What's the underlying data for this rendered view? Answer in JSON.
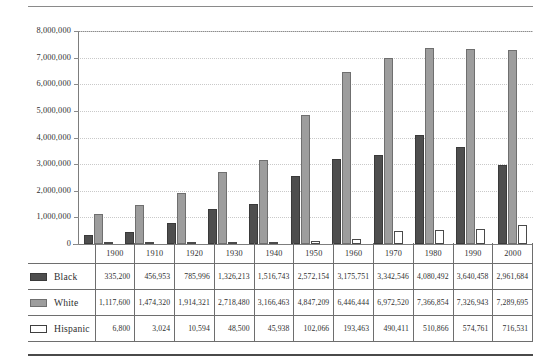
{
  "chart_data": {
    "type": "bar",
    "title": "",
    "xlabel": "",
    "ylabel": "",
    "categories": [
      "1900",
      "1910",
      "1920",
      "1930",
      "1940",
      "1950",
      "1960",
      "1970",
      "1980",
      "1990",
      "2000"
    ],
    "series": [
      {
        "name": "Black",
        "color": "#4e4e4e",
        "values": [
          335200,
          456953,
          785996,
          1326213,
          1516743,
          2572154,
          3175751,
          3342546,
          4080492,
          3640458,
          2961684
        ],
        "labels": [
          "335,200",
          "456,953",
          "785,996",
          "1,326,213",
          "1,516,743",
          "2,572,154",
          "3,175,751",
          "3,342,546",
          "4,080,492",
          "3,640,458",
          "2,961,684"
        ]
      },
      {
        "name": "White",
        "color": "#9d9d9d",
        "values": [
          1117600,
          1474320,
          1914321,
          2718480,
          3166463,
          4847209,
          6446444,
          6972520,
          7366854,
          7326943,
          7289695
        ],
        "labels": [
          "1,117,600",
          "1,474,320",
          "1,914,321",
          "2,718,480",
          "3,166,463",
          "4,847,209",
          "6,446,444",
          "6,972,520",
          "7,366,854",
          "7,326,943",
          "7,289,695"
        ]
      },
      {
        "name": "Hispanic",
        "color": "#ffffff",
        "values": [
          6800,
          3024,
          10594,
          48500,
          45938,
          102066,
          193463,
          490411,
          510866,
          574761,
          716531
        ],
        "labels": [
          "6,800",
          "3,024",
          "10,594",
          "48,500",
          "45,938",
          "102,066",
          "193,463",
          "490,411",
          "510,866",
          "574,761",
          "716,531"
        ]
      }
    ],
    "ylim": [
      0,
      8000000
    ],
    "yticks": [
      0,
      1000000,
      2000000,
      3000000,
      4000000,
      5000000,
      6000000,
      7000000,
      8000000
    ],
    "ytick_labels": [
      "0",
      "1,000,000",
      "2,000,000",
      "3,000,000",
      "4,000,000",
      "5,000,000",
      "6,000,000",
      "7,000,000",
      "8,000,000"
    ],
    "grid": true,
    "legend_position": "table-left"
  },
  "table": {
    "year_headers": [
      "1900",
      "1910",
      "1920",
      "1930",
      "1940",
      "1950",
      "1960",
      "1970",
      "1980",
      "1990",
      "2000"
    ],
    "rows": [
      {
        "label": "Black",
        "swatch": "swatch-black",
        "values": [
          "335,200",
          "456,953",
          "785,996",
          "1,326,213",
          "1,516,743",
          "2,572,154",
          "3,175,751",
          "3,342,546",
          "4,080,492",
          "3,640,458",
          "2,961,684"
        ]
      },
      {
        "label": "White",
        "swatch": "swatch-white",
        "values": [
          "1,117,600",
          "1,474,320",
          "1,914,321",
          "2,718,480",
          "3,166,463",
          "4,847,209",
          "6,446,444",
          "6,972,520",
          "7,366,854",
          "7,326,943",
          "7,289,695"
        ]
      },
      {
        "label": "Hispanic",
        "swatch": "swatch-hispanic",
        "values": [
          "6,800",
          "3,024",
          "10,594",
          "48,500",
          "45,938",
          "102,066",
          "193,463",
          "490,411",
          "510,866",
          "574,761",
          "716,531"
        ]
      }
    ]
  }
}
